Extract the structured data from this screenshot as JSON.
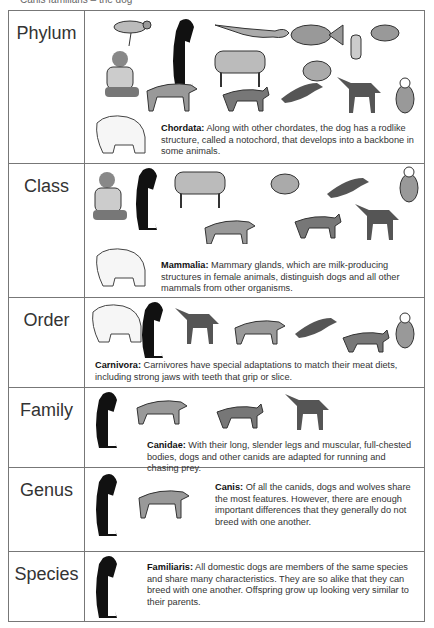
{
  "top_fragment": "Canis familiaris – the dog",
  "rows": [
    {
      "rank": "Phylum",
      "term": "Chordata:",
      "text": " Along with other chordates, the dog has a rodlike structure, called a notochord, that develops into a backbone in some animals."
    },
    {
      "rank": "Class",
      "term": "Mammalia:",
      "text": " Mammary glands, which are milk-producing structures in female animals, distinguish dogs and all other mammals from other organisms."
    },
    {
      "rank": "Order",
      "term": "Carnivora:",
      "text": " Carnivores have special adaptations to match their meat diets, including strong jaws with teeth that grip or slice."
    },
    {
      "rank": "Family",
      "term": "Canidae:",
      "text": " With their long, slender legs and muscular, full-chested bodies, dogs and other canids are adapted for running and chasing prey."
    },
    {
      "rank": "Genus",
      "term": "Canis:",
      "text": " Of all the canids, dogs and wolves share the most features. However, there are enough important differences that they generally do not breed with one another."
    },
    {
      "rank": "Species",
      "term": "Familiaris:",
      "text": " All domestic dogs are members of the same species and share many characteristics. They are so alike that they can breed with one another. Offspring grow up looking very similar to their parents."
    }
  ],
  "illustrations": {
    "phylum": [
      "bird",
      "dog",
      "lizard",
      "fish",
      "worm",
      "frog",
      "boy",
      "cow",
      "mouse",
      "wolf",
      "fox",
      "ferret",
      "maned-wolf",
      "cat",
      "polar-bear"
    ],
    "class": [
      "boy",
      "dog",
      "cow",
      "mouse",
      "ferret",
      "cat",
      "fox",
      "maned-wolf",
      "wolf",
      "polar-bear"
    ],
    "order": [
      "polar-bear",
      "dog",
      "maned-wolf",
      "wolf",
      "ferret",
      "fox",
      "cat"
    ],
    "family": [
      "dog",
      "wolf",
      "fox",
      "maned-wolf"
    ],
    "genus": [
      "dog",
      "wolf"
    ],
    "species": [
      "dog"
    ]
  }
}
